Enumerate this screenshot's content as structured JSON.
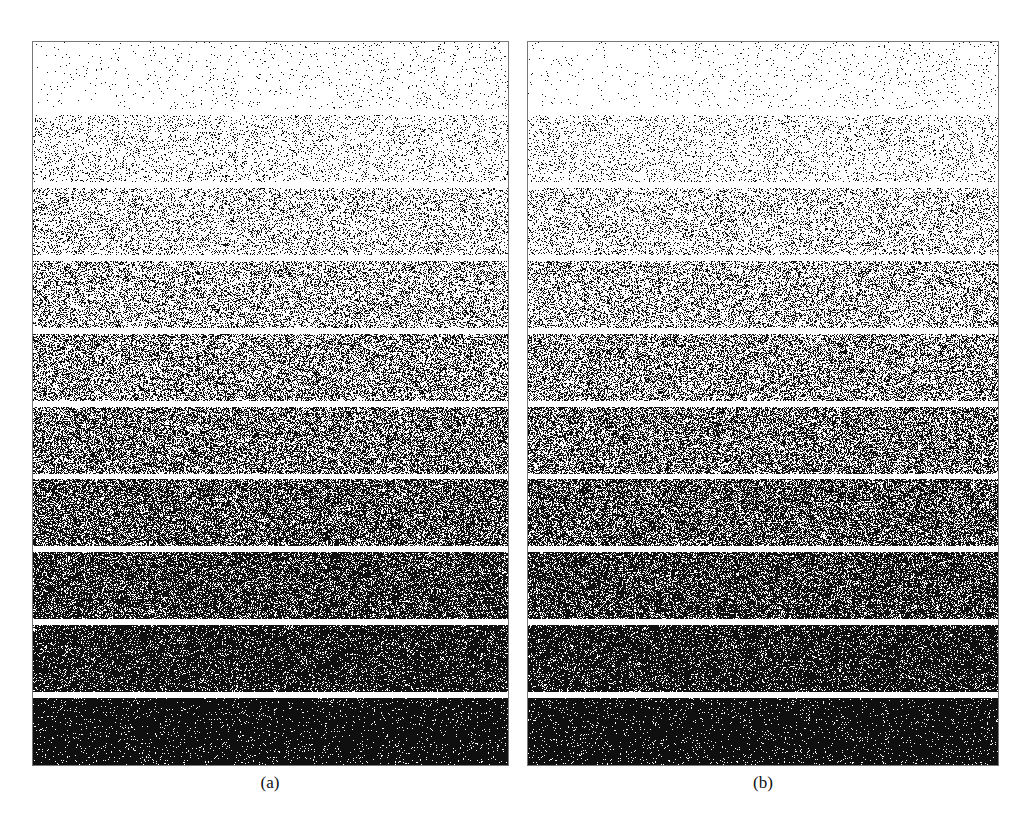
{
  "figure": {
    "panels": [
      {
        "id": "a",
        "caption": "(a)",
        "bands": 10
      },
      {
        "id": "b",
        "caption": "(b)",
        "bands": 10
      }
    ],
    "band_gray_levels": [
      0.04,
      0.12,
      0.22,
      0.33,
      0.44,
      0.55,
      0.66,
      0.76,
      0.86,
      0.95
    ]
  },
  "captions": {
    "a": "(a)",
    "b": "(b)"
  }
}
